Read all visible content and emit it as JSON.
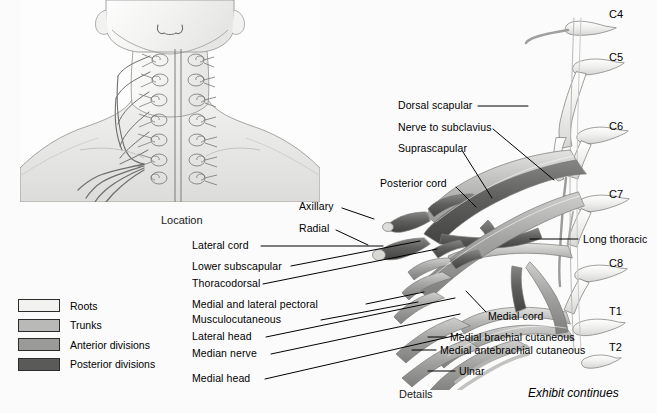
{
  "figure": {
    "inset_caption": "Location",
    "main_caption": "Details",
    "continuation_note": "Exhibit continues"
  },
  "legend": {
    "items": [
      {
        "label": "Roots",
        "color": "#f2f2f0"
      },
      {
        "label": "Trunks",
        "color": "#b9b9b7"
      },
      {
        "label": "Anterior divisions",
        "color": "#9a9a98"
      },
      {
        "label": "Posterior divisions",
        "color": "#5a5a58"
      }
    ]
  },
  "spinal_segments": [
    {
      "label": "C4",
      "x": 609,
      "y": 14
    },
    {
      "label": "C5",
      "x": 609,
      "y": 57
    },
    {
      "label": "C6",
      "x": 609,
      "y": 126
    },
    {
      "label": "C7",
      "x": 609,
      "y": 194
    },
    {
      "label": "C8",
      "x": 609,
      "y": 263
    },
    {
      "label": "T1",
      "x": 609,
      "y": 311
    },
    {
      "label": "T2",
      "x": 609,
      "y": 347
    }
  ],
  "labels_upper_right": [
    {
      "name": "dorsal-scapular",
      "text": "Dorsal scapular",
      "x": 398,
      "y": 106
    },
    {
      "name": "nerve-to-subclavius",
      "text": "Nerve to subclavius",
      "x": 398,
      "y": 127
    },
    {
      "name": "suprascapular",
      "text": "Suprascapular",
      "x": 398,
      "y": 148
    }
  ],
  "labels_left": [
    {
      "name": "posterior-cord",
      "text": "Posterior cord",
      "x": 380,
      "y": 183,
      "align": "left"
    },
    {
      "name": "axillary",
      "text": "Axillary",
      "x": 299,
      "y": 206,
      "align": "left"
    },
    {
      "name": "radial",
      "text": "Radial",
      "x": 299,
      "y": 228,
      "align": "left"
    },
    {
      "name": "lateral-cord",
      "text": "Lateral cord",
      "x": 192,
      "y": 245,
      "align": "left"
    },
    {
      "name": "lower-subscapular",
      "text": "Lower subscapular",
      "x": 192,
      "y": 266,
      "align": "left"
    },
    {
      "name": "thoracodorsal",
      "text": "Thoracodorsal",
      "x": 192,
      "y": 283,
      "align": "left"
    },
    {
      "name": "medial-and-lateral-pectoral",
      "text": "Medial and lateral pectoral",
      "x": 192,
      "y": 304,
      "align": "left"
    },
    {
      "name": "musculocutaneous",
      "text": "Musculocutaneous",
      "x": 192,
      "y": 319,
      "align": "left"
    },
    {
      "name": "lateral-head",
      "text": "Lateral head",
      "x": 192,
      "y": 336,
      "align": "left"
    },
    {
      "name": "median-nerve",
      "text": "Median nerve",
      "x": 192,
      "y": 353,
      "align": "left"
    },
    {
      "name": "medial-head",
      "text": "Medial head",
      "x": 192,
      "y": 378,
      "align": "left"
    }
  ],
  "labels_right": [
    {
      "name": "long-thoracic",
      "text": "Long thoracic",
      "x": 583,
      "y": 239
    },
    {
      "name": "medial-cord",
      "text": "Medial cord",
      "x": 488,
      "y": 316
    },
    {
      "name": "medial-brachial-cutaneous",
      "text": "Medial brachial cutaneous",
      "x": 450,
      "y": 337
    },
    {
      "name": "medial-antebrachial-cutaneous",
      "text": "Medial antebrachial cutaneous",
      "x": 440,
      "y": 350
    },
    {
      "name": "ulnar",
      "text": "Ulnar",
      "x": 459,
      "y": 371
    }
  ],
  "palette": {
    "roots": "#e9e9e7",
    "trunks": "#b9b9b7",
    "anterior_divisions": "#9a9a98",
    "posterior_divisions": "#5a5a58",
    "outline": "#7a7a78",
    "leader": "#000000",
    "background": "#fbfbfb"
  }
}
